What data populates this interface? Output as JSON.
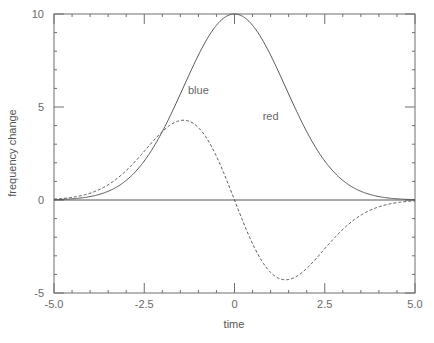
{
  "chart_data": {
    "type": "line",
    "title": "",
    "xlabel": "time",
    "ylabel": "frequency change",
    "xlim": [
      -5.0,
      5.0
    ],
    "ylim": [
      -5,
      10
    ],
    "grid": false,
    "legend": null,
    "x_ticks": [
      -5.0,
      -2.5,
      0,
      2.5,
      5.0
    ],
    "x_tick_labels": [
      "-5.0",
      "-2.5",
      "0",
      "2.5",
      "5.0"
    ],
    "x_minor_step": 0.5,
    "y_ticks": [
      -5,
      0,
      5,
      10
    ],
    "y_tick_labels": [
      "-5",
      "0",
      "5",
      "10"
    ],
    "y_minor_step": 1,
    "series": [
      {
        "name": "gaussian (solid)",
        "style": "solid",
        "color": "#555555",
        "x": [
          -5.0,
          -4.5,
          -4.0,
          -3.5,
          -3.0,
          -2.5,
          -2.0,
          -1.5,
          -1.0,
          -0.5,
          0.0,
          0.5,
          1.0,
          1.5,
          2.0,
          2.5,
          3.0,
          3.5,
          4.0,
          4.5,
          5.0
        ],
        "values": [
          0.02,
          0.06,
          0.18,
          0.47,
          1.05,
          2.1,
          3.68,
          5.7,
          7.79,
          9.39,
          10.0,
          9.39,
          7.79,
          5.7,
          3.68,
          2.1,
          1.05,
          0.47,
          0.18,
          0.06,
          0.02
        ]
      },
      {
        "name": "derivative (dashed)",
        "style": "dashed",
        "color": "#555555",
        "x": [
          -5.0,
          -4.5,
          -4.0,
          -3.5,
          -3.0,
          -2.5,
          -2.0,
          -1.5,
          -1.0,
          -0.5,
          0.0,
          0.5,
          1.0,
          1.5,
          2.0,
          2.5,
          3.0,
          3.5,
          4.0,
          4.5,
          5.0
        ],
        "values": [
          0.05,
          0.14,
          0.37,
          0.82,
          1.58,
          2.62,
          3.68,
          4.27,
          3.89,
          2.35,
          0.0,
          -2.35,
          -3.89,
          -4.27,
          -3.68,
          -2.62,
          -1.58,
          -0.82,
          -0.37,
          -0.14,
          -0.05
        ]
      },
      {
        "name": "zero line",
        "style": "solid",
        "color": "#555555",
        "x": [
          -5.0,
          5.0
        ],
        "values": [
          0,
          0
        ]
      }
    ],
    "annotations": [
      {
        "text": "blue",
        "x": -1.0,
        "y": 5.7
      },
      {
        "text": "red",
        "x": 1.0,
        "y": 4.3
      }
    ]
  }
}
